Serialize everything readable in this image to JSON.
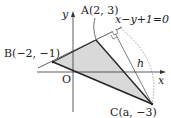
{
  "diagram": {
    "type": "coordinate-geometry",
    "axes": {
      "x_label": "x",
      "y_label": "y",
      "origin_label": "O"
    },
    "points": {
      "A": {
        "label": "A(2, 3)",
        "coords": [
          2,
          3
        ]
      },
      "B": {
        "label": "B(−2, −1)",
        "coords": [
          -2,
          -1
        ]
      },
      "C": {
        "label": "C(a, −3)",
        "coords": [
          "a",
          -3
        ]
      }
    },
    "line": {
      "equation": "x−y+1=0"
    },
    "height_label": "h",
    "colors": {
      "fill": "#d9d9d9",
      "stroke": "#222222",
      "thin": "#444444"
    }
  }
}
